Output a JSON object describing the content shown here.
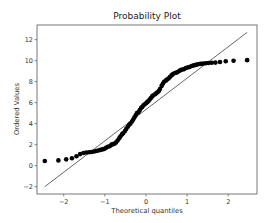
{
  "chart_data": {
    "type": "scatter",
    "title": "Probability Plot",
    "xlabel": "Theoretical quantiles",
    "ylabel": "Ordered Values",
    "xlim": [
      -2.65,
      2.7
    ],
    "ylim": [
      -2.7,
      13.4
    ],
    "xticks": [
      -2,
      -1,
      0,
      1,
      2
    ],
    "yticks": [
      -2,
      0,
      2,
      4,
      6,
      8,
      10,
      12
    ],
    "grid": false,
    "legend": null,
    "series": [
      {
        "name": "Ordered Values",
        "kind": "points",
        "color": "#000000",
        "x": [
          -2.46,
          -2.13,
          -1.94,
          -1.8,
          -1.69,
          -1.6,
          -1.52,
          -1.45,
          -1.38,
          -1.32,
          -1.26,
          -1.21,
          -1.16,
          -1.11,
          -1.06,
          -1.01,
          -0.97,
          -0.93,
          -0.88,
          -0.84,
          -0.8,
          -0.76,
          -0.73,
          -0.69,
          -0.65,
          -0.62,
          -0.58,
          -0.55,
          -0.51,
          -0.48,
          -0.44,
          -0.41,
          -0.38,
          -0.34,
          -0.31,
          -0.28,
          -0.25,
          -0.22,
          -0.18,
          -0.15,
          -0.12,
          -0.09,
          -0.06,
          -0.03,
          0.0,
          0.03,
          0.06,
          0.09,
          0.12,
          0.15,
          0.18,
          0.22,
          0.25,
          0.28,
          0.31,
          0.34,
          0.38,
          0.41,
          0.44,
          0.48,
          0.51,
          0.55,
          0.58,
          0.62,
          0.65,
          0.69,
          0.73,
          0.76,
          0.8,
          0.84,
          0.88,
          0.93,
          0.97,
          1.01,
          1.06,
          1.11,
          1.16,
          1.21,
          1.26,
          1.32,
          1.38,
          1.45,
          1.52,
          1.6,
          1.69,
          1.8,
          1.94,
          2.13,
          2.46
        ],
        "y": [
          0.45,
          0.5,
          0.6,
          0.7,
          0.9,
          1.1,
          1.2,
          1.25,
          1.28,
          1.3,
          1.35,
          1.4,
          1.45,
          1.5,
          1.55,
          1.6,
          1.7,
          1.8,
          1.85,
          2.0,
          2.05,
          2.1,
          2.2,
          2.4,
          2.6,
          2.8,
          3.0,
          3.1,
          3.3,
          3.5,
          3.7,
          3.9,
          4.0,
          4.2,
          4.4,
          4.6,
          4.8,
          5.0,
          5.1,
          5.3,
          5.5,
          5.6,
          5.75,
          5.85,
          5.95,
          6.05,
          6.15,
          6.3,
          6.45,
          6.6,
          6.7,
          6.8,
          6.9,
          7.0,
          7.1,
          7.3,
          7.6,
          7.8,
          8.0,
          8.1,
          8.2,
          8.3,
          8.45,
          8.6,
          8.7,
          8.8,
          8.85,
          8.9,
          9.0,
          9.1,
          9.15,
          9.2,
          9.3,
          9.35,
          9.4,
          9.5,
          9.55,
          9.6,
          9.65,
          9.7,
          9.72,
          9.75,
          9.78,
          9.8,
          9.82,
          9.87,
          9.95,
          10.0,
          10.05
        ]
      },
      {
        "name": "Fit line",
        "kind": "line",
        "color": "#555555",
        "x": [
          -2.46,
          2.46
        ],
        "y": [
          -2.0,
          12.7
        ]
      }
    ]
  }
}
